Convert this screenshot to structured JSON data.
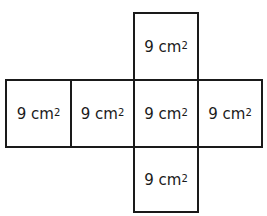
{
  "diagram": {
    "type": "cube-net",
    "faces": [
      {
        "id": "top",
        "value": "9 cm",
        "exponent": "2"
      },
      {
        "id": "left-1",
        "value": "9 cm",
        "exponent": "2"
      },
      {
        "id": "left-2",
        "value": "9 cm",
        "exponent": "2"
      },
      {
        "id": "center",
        "value": "9 cm",
        "exponent": "2"
      },
      {
        "id": "right",
        "value": "9 cm",
        "exponent": "2"
      },
      {
        "id": "bottom",
        "value": "9 cm",
        "exponent": "2"
      }
    ],
    "colors": {
      "line": "#1a1a1a",
      "background": "#ffffff"
    }
  }
}
